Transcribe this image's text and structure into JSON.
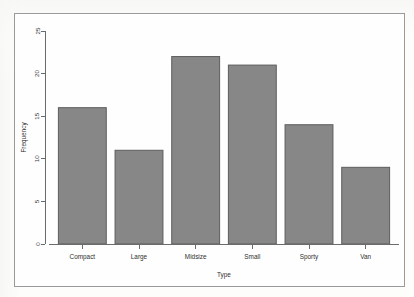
{
  "figure": {
    "background_color": "#fdfdfc",
    "frame_color": "#9a9a9a",
    "bar_fill_color": "#878787",
    "bar_border_color": "#5d5d5d",
    "axis_color": "#6b6b6b"
  },
  "chart_data": {
    "type": "bar",
    "title": "",
    "subtitle": "",
    "xlabel": "Type",
    "ylabel": "Frequency",
    "categories": [
      "Compact",
      "Large",
      "Midsize",
      "Small",
      "Sporty",
      "Van"
    ],
    "values": [
      16,
      11,
      22,
      21,
      14,
      9
    ],
    "ylim": [
      0,
      25
    ],
    "yticks": [
      0,
      5,
      10,
      15,
      20,
      25
    ],
    "ytick_labels": [
      "0",
      "5",
      "10",
      "15",
      "20",
      "25"
    ],
    "grid": false,
    "legend": null,
    "legend_position": "none",
    "series": [
      {
        "name": "Frequency",
        "values": [
          16,
          11,
          22,
          21,
          14,
          9
        ]
      }
    ],
    "annotations": []
  }
}
